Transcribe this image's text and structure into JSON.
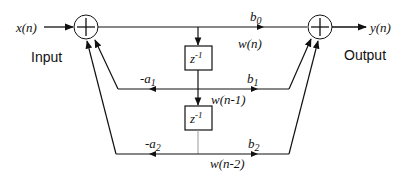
{
  "diagram": {
    "type": "IIR biquad filter, Direct Form II block diagram",
    "input": {
      "signal": "x(n)",
      "label": "Input"
    },
    "output": {
      "signal": "y(n)",
      "label": "Output"
    },
    "state_labels": {
      "w0": "w(n)",
      "w1": "w(n-1)",
      "w2": "w(n-2)"
    },
    "delay_blocks": [
      {
        "base": "z",
        "exp": "-1"
      },
      {
        "base": "z",
        "exp": "-1"
      }
    ],
    "coefficients": {
      "b0": {
        "base": "b",
        "sub": "0"
      },
      "b1": {
        "base": "b",
        "sub": "1"
      },
      "b2": {
        "base": "b",
        "sub": "2"
      },
      "a1": {
        "base": "-a",
        "sub": "1"
      },
      "a2": {
        "base": "-a",
        "sub": "2"
      }
    },
    "adders": [
      "left-summing-junction",
      "right-summing-junction"
    ],
    "colors": {
      "stroke": "#111111",
      "background": "#ffffff",
      "faint_line": "#999999"
    }
  }
}
